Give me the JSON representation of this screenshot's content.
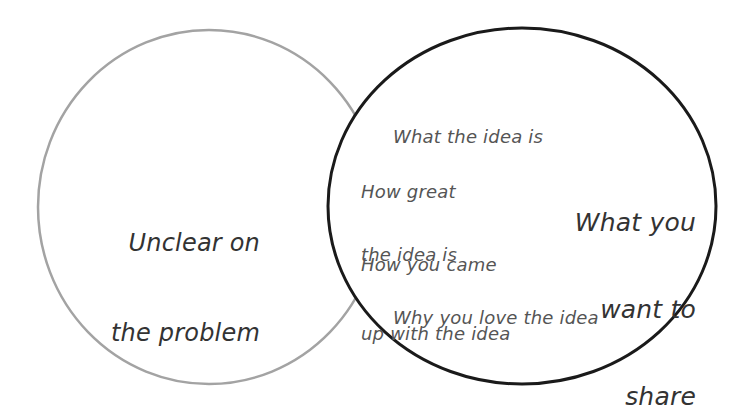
{
  "diagram": {
    "type": "venn",
    "colors": {
      "background": "#ffffff",
      "left_stroke": "#a3a3a3",
      "right_stroke": "#1a1a1a",
      "right_fill": "#ffffff",
      "primary_text": "#333333",
      "secondary_text": "#555555"
    },
    "left_circle": {
      "label_lines": [
        "Unclear on",
        "the problem"
      ]
    },
    "right_circle": {
      "title_lines": [
        "What you",
        "want to",
        "share"
      ],
      "items": [
        {
          "lines": [
            "What the idea is"
          ]
        },
        {
          "lines": [
            "How great",
            "the idea is"
          ]
        },
        {
          "lines": [
            "How you came",
            "up with the idea"
          ]
        },
        {
          "lines": [
            "Why you love the idea"
          ]
        }
      ]
    }
  }
}
